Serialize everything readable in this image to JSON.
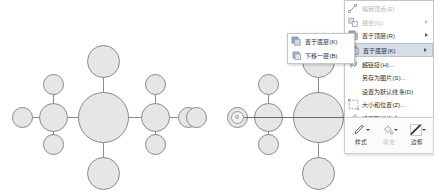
{
  "app": {
    "context": "office-shape-right-click-menu",
    "canvas_background": "#ffffff"
  },
  "colors": {
    "shape_fill": "#e6e6e6",
    "shape_stroke": "#8a8a8a",
    "menu_background": "#ffffff",
    "menu_border": "#c6c6c6",
    "menu_text": "#2b2b2b",
    "menu_text_disabled": "#b4b4b4",
    "menu_highlight": "#d6dde6",
    "selection_handle": "#9b9b9b"
  },
  "diagrams": {
    "left": {
      "name": "molecule-diagram-before",
      "caption": "",
      "nodes": [
        {
          "id": "center",
          "cx": 103,
          "cy": 117,
          "r": 25.5
        },
        {
          "id": "top",
          "cx": 103,
          "cy": 61,
          "r": 16.5
        },
        {
          "id": "bottom",
          "cx": 103,
          "cy": 173,
          "r": 16.5
        },
        {
          "id": "left-mid",
          "cx": 53,
          "cy": 117,
          "r": 14.5
        },
        {
          "id": "right-mid",
          "cx": 155,
          "cy": 117,
          "r": 14.5
        },
        {
          "id": "left-up",
          "cx": 53,
          "cy": 84,
          "r": 10.5
        },
        {
          "id": "left-down",
          "cx": 53,
          "cy": 144,
          "r": 10.5
        },
        {
          "id": "left-far",
          "cx": 22,
          "cy": 117,
          "r": 10.5
        },
        {
          "id": "right-up",
          "cx": 155,
          "cy": 84,
          "r": 10.5
        },
        {
          "id": "right-down",
          "cx": 155,
          "cy": 144,
          "r": 10.5
        },
        {
          "id": "right-far",
          "cx": 188,
          "cy": 117,
          "r": 10.5
        }
      ],
      "bonds": [
        {
          "from": "center",
          "to": "top"
        },
        {
          "from": "center",
          "to": "bottom"
        },
        {
          "from": "center",
          "to": "left-mid"
        },
        {
          "from": "center",
          "to": "right-mid"
        },
        {
          "from": "left-mid",
          "to": "left-up"
        },
        {
          "from": "left-mid",
          "to": "left-down"
        },
        {
          "from": "left-mid",
          "to": "left-far"
        },
        {
          "from": "right-mid",
          "to": "right-up"
        },
        {
          "from": "right-mid",
          "to": "right-down"
        },
        {
          "from": "right-mid",
          "to": "right-far"
        }
      ]
    },
    "right": {
      "name": "molecule-diagram-after",
      "caption": "",
      "selected_shape": "horizontal-connector-line",
      "nodes": [
        {
          "id": "center",
          "cx": 318,
          "cy": 117,
          "r": 25.5
        },
        {
          "id": "top",
          "cx": 318,
          "cy": 61,
          "r": 16.5
        },
        {
          "id": "bottom",
          "cx": 318,
          "cy": 173,
          "r": 16.5
        },
        {
          "id": "left-mid",
          "cx": 268,
          "cy": 117,
          "r": 14.5
        },
        {
          "id": "left-up",
          "cx": 268,
          "cy": 84,
          "r": 10.5
        },
        {
          "id": "left-down",
          "cx": 268,
          "cy": 144,
          "r": 10.5
        },
        {
          "id": "left-far",
          "cx": 237,
          "cy": 117,
          "r": 10.5
        },
        {
          "id": "edge-clip",
          "cx": 196,
          "cy": 117,
          "r": 10.5
        }
      ],
      "bonds": [
        {
          "from": "center",
          "to": "top"
        },
        {
          "from": "center",
          "to": "bottom"
        },
        {
          "from": "left-mid",
          "to": "left-up"
        },
        {
          "from": "left-mid",
          "to": "left-down"
        }
      ],
      "selection_line": {
        "x1": 237,
        "x2": 398,
        "y": 117
      },
      "selection_handle": {
        "cx": 237,
        "cy": 117
      }
    }
  },
  "context_menu": {
    "name": "shape-context-menu",
    "x": 344,
    "y": 0,
    "width": 90,
    "items": [
      {
        "id": "edit-points",
        "label": "编辑顶点(E)",
        "icon": "edit-points-icon",
        "disabled": true,
        "submenu": false,
        "highlighted": false
      },
      {
        "id": "group",
        "label": "组合(G)",
        "icon": "group-icon",
        "disabled": true,
        "submenu": true,
        "highlighted": false
      },
      {
        "id": "bring-to-front",
        "label": "置于顶层(R)",
        "icon": "bring-front-icon",
        "disabled": false,
        "submenu": true,
        "highlighted": false
      },
      {
        "id": "send-to-back",
        "label": "置于底层(K)",
        "icon": "send-back-icon",
        "disabled": false,
        "submenu": true,
        "highlighted": true
      },
      {
        "id": "hyperlink",
        "label": "超链接(H)...",
        "icon": "hyperlink-icon",
        "disabled": false,
        "submenu": false,
        "highlighted": false
      },
      {
        "id": "save-as-picture",
        "label": "另存为图片(S)...",
        "icon": "none",
        "disabled": false,
        "submenu": false,
        "highlighted": false
      },
      {
        "id": "set-default-line",
        "label": "设置为默认线条(D)",
        "icon": "none",
        "disabled": false,
        "submenu": false,
        "highlighted": false
      },
      {
        "id": "size-position",
        "label": "大小和位置(Z)...",
        "icon": "size-position-icon",
        "disabled": false,
        "submenu": false,
        "highlighted": false
      },
      {
        "id": "format-shape",
        "label": "设置形状格式(O)...",
        "icon": "format-shape-icon",
        "disabled": false,
        "submenu": false,
        "highlighted": false
      }
    ]
  },
  "submenu": {
    "name": "send-to-back-submenu",
    "x": 287,
    "y": 33,
    "width": 68,
    "items": [
      {
        "id": "send-to-back-cmd",
        "label": "置于底层(K)",
        "icon": "send-back-icon"
      },
      {
        "id": "send-backward",
        "label": "下移一层(B)",
        "icon": "send-backward-icon"
      }
    ]
  },
  "mini_toolbar": {
    "name": "floating-mini-toolbar",
    "x": 344,
    "y": 117,
    "width": 90,
    "height": 37,
    "buttons": [
      {
        "id": "style",
        "label": "样式",
        "icon": "shape-style-icon",
        "dim": false,
        "caret": true
      },
      {
        "id": "fill",
        "label": "填充",
        "icon": "fill-bucket-icon",
        "dim": true,
        "caret": true
      },
      {
        "id": "border",
        "label": "边框",
        "icon": "shape-border-icon",
        "dim": false,
        "caret": true
      }
    ]
  }
}
